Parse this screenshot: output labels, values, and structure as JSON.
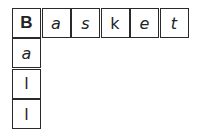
{
  "puzzle": {
    "across_word": "Basket",
    "down_word": "Ball",
    "across": [
      "B",
      "a",
      "s",
      "k",
      "e",
      "t"
    ],
    "down": [
      "a",
      "l",
      "l"
    ]
  }
}
